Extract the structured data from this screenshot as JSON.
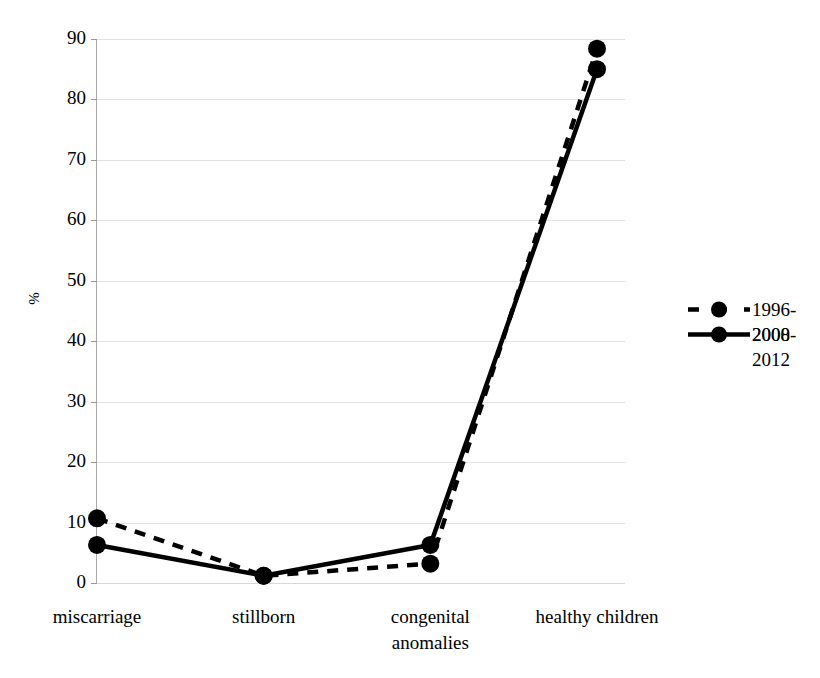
{
  "chart_data": {
    "type": "line",
    "title": "",
    "xlabel": "",
    "ylabel": "%",
    "ylim": [
      0,
      90
    ],
    "yticks": [
      0,
      10,
      20,
      30,
      40,
      50,
      60,
      70,
      80,
      90
    ],
    "grid": true,
    "legend_position": "right",
    "categories": [
      "miscarriage",
      "stillborn",
      "congenital anomalies",
      "healthy children"
    ],
    "category_lines": [
      [
        "miscarriage"
      ],
      [
        "stillborn"
      ],
      [
        "congenital",
        "anomalies"
      ],
      [
        "healthy children"
      ]
    ],
    "series": [
      {
        "name": "1996-2000",
        "label_lines": [
          "1996-",
          "2000"
        ],
        "style": "dashed",
        "color": "#000000",
        "marker": "circle",
        "values": [
          10.7,
          1.2,
          3.2,
          88.4
        ]
      },
      {
        "name": "2008-2012",
        "label_lines": [
          "2008-",
          "2012"
        ],
        "style": "solid",
        "color": "#000000",
        "marker": "circle",
        "values": [
          6.3,
          1.2,
          6.3,
          85.0
        ]
      }
    ]
  },
  "axes": {
    "y_label": "%",
    "y_tick_labels": [
      "90",
      "80",
      "70",
      "60",
      "50",
      "40",
      "30",
      "20",
      "10",
      "0"
    ],
    "x_tick_labels": [
      "miscarriage",
      "stillborn",
      "congenital\nanomalies",
      "healthy children"
    ]
  },
  "legend": {
    "entries": [
      {
        "label": "1996-\n2000",
        "style": "dashed"
      },
      {
        "label": "2008-\n2012",
        "style": "solid"
      }
    ]
  },
  "colors": {
    "series": "#000000",
    "gridline": "#e2e2e2",
    "axis": "#aaaaaa",
    "background": "#ffffff"
  }
}
